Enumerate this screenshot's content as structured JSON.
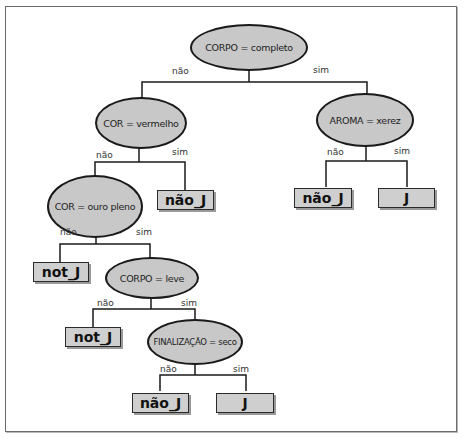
{
  "diagram": {
    "type": "decision-tree",
    "colors": {
      "node_fill": "#c8c8c8",
      "node_border": "#1a1a1a",
      "leaf_fill": "#cfcfcf",
      "line": "#1a1a1a",
      "frame": "#6a6a6a"
    },
    "nodes": {
      "root": {
        "label": "CORPO = completo"
      },
      "cor_vermelho": {
        "label": "COR = vermelho"
      },
      "aroma_xerez": {
        "label": "AROMA = xerez"
      },
      "cor_ouro": {
        "label": "COR = ouro pleno"
      },
      "corpo_leve": {
        "label": "CORPO = leve"
      },
      "finalizacao": {
        "label": "FINALIZAÇÃO = seco"
      }
    },
    "leaves": {
      "vermelho_sim": {
        "label": "não_J"
      },
      "aroma_nao": {
        "label": "não_J"
      },
      "aroma_sim": {
        "label": "J"
      },
      "ouro_nao": {
        "label": "not_J"
      },
      "leve_nao": {
        "label": "not_J"
      },
      "final_nao": {
        "label": "não_J"
      },
      "final_sim": {
        "label": "J"
      }
    },
    "edges": {
      "root_no": "não",
      "root_yes": "sim",
      "vermelho_no": "não",
      "vermelho_yes": "sim",
      "aroma_no": "não",
      "aroma_yes": "sim",
      "ouro_no": "não",
      "ouro_yes": "sim",
      "leve_no": "não",
      "leve_yes": "sim",
      "final_no": "não",
      "final_yes": "sim"
    }
  }
}
